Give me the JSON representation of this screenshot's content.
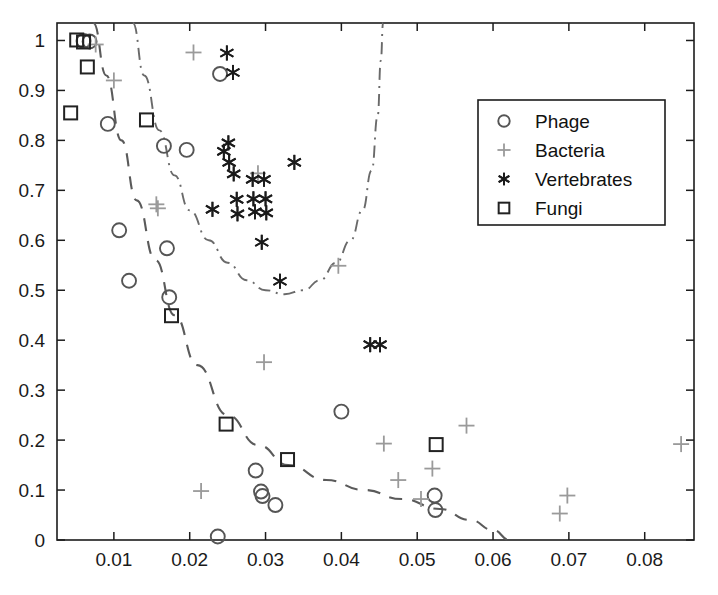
{
  "chart_data": {
    "type": "scatter",
    "title": "",
    "xlabel": "",
    "ylabel": "",
    "xlim": [
      0.0025,
      0.0865
    ],
    "ylim": [
      0.0,
      1.035
    ],
    "grid": false,
    "legend_position": "upper-right",
    "xticks": [
      0.01,
      0.02,
      0.03,
      0.04,
      0.05,
      0.06,
      0.07,
      0.08
    ],
    "xtick_labels": [
      "0.01",
      "0.02",
      "0.03",
      "0.04",
      "0.05",
      "0.06",
      "0.07",
      "0.08"
    ],
    "yticks": [
      0,
      0.1,
      0.2,
      0.3,
      0.4,
      0.5,
      0.6,
      0.7,
      0.8,
      0.9,
      1
    ],
    "ytick_labels": [
      "0",
      "0.1",
      "0.2",
      "0.3",
      "0.4",
      "0.5",
      "0.6",
      "0.7",
      "0.8",
      "0.9",
      "1"
    ],
    "series": [
      {
        "name": "Phage",
        "marker": "circle",
        "color": "#555555",
        "points": [
          [
            0.006,
            0.999
          ],
          [
            0.0068,
            0.998
          ],
          [
            0.0092,
            0.833
          ],
          [
            0.0107,
            0.62
          ],
          [
            0.012,
            0.519
          ],
          [
            0.0166,
            0.789
          ],
          [
            0.017,
            0.584
          ],
          [
            0.0173,
            0.486
          ],
          [
            0.0196,
            0.781
          ],
          [
            0.0237,
            0.007
          ],
          [
            0.024,
            0.933
          ],
          [
            0.0287,
            0.139
          ],
          [
            0.0294,
            0.097
          ],
          [
            0.0296,
            0.088
          ],
          [
            0.0313,
            0.07
          ],
          [
            0.04,
            0.257
          ],
          [
            0.0523,
            0.089
          ],
          [
            0.0524,
            0.06
          ]
        ]
      },
      {
        "name": "Bacteria",
        "marker": "plus",
        "color": "#9a9a9a",
        "points": [
          [
            0.0076,
            0.992
          ],
          [
            0.01,
            0.92
          ],
          [
            0.0156,
            0.672
          ],
          [
            0.0158,
            0.664
          ],
          [
            0.0205,
            0.976
          ],
          [
            0.0215,
            0.098
          ],
          [
            0.029,
            0.734
          ],
          [
            0.0298,
            0.356
          ],
          [
            0.0396,
            0.549
          ],
          [
            0.0456,
            0.193
          ],
          [
            0.0475,
            0.12
          ],
          [
            0.0505,
            0.082
          ],
          [
            0.052,
            0.143
          ],
          [
            0.0565,
            0.229
          ],
          [
            0.0698,
            0.089
          ],
          [
            0.0688,
            0.053
          ],
          [
            0.0848,
            0.192
          ]
        ]
      },
      {
        "name": "Vertebrates",
        "marker": "star",
        "color": "#1b1b1b",
        "points": [
          [
            0.0249,
            0.975
          ],
          [
            0.0257,
            0.936
          ],
          [
            0.0245,
            0.778
          ],
          [
            0.0251,
            0.795
          ],
          [
            0.0252,
            0.756
          ],
          [
            0.0258,
            0.733
          ],
          [
            0.0262,
            0.682
          ],
          [
            0.0263,
            0.653
          ],
          [
            0.0283,
            0.722
          ],
          [
            0.0284,
            0.683
          ],
          [
            0.0286,
            0.657
          ],
          [
            0.0298,
            0.722
          ],
          [
            0.03,
            0.683
          ],
          [
            0.0301,
            0.655
          ],
          [
            0.0295,
            0.596
          ],
          [
            0.0319,
            0.518
          ],
          [
            0.0338,
            0.756
          ],
          [
            0.0438,
            0.391
          ],
          [
            0.0451,
            0.391
          ],
          [
            0.023,
            0.662
          ]
        ]
      },
      {
        "name": "Fungi",
        "marker": "square",
        "color": "#222222",
        "points": [
          [
            0.0043,
            0.855
          ],
          [
            0.0051,
            1.001
          ],
          [
            0.006,
            0.997
          ],
          [
            0.0065,
            0.947
          ],
          [
            0.0143,
            0.841
          ],
          [
            0.0176,
            0.449
          ],
          [
            0.0248,
            0.232
          ],
          [
            0.0329,
            0.161
          ],
          [
            0.0525,
            0.191
          ]
        ]
      }
    ],
    "curves": [
      {
        "name": "dashed-boundary",
        "style": "dashed",
        "color": "#5a5a5a",
        "points": [
          [
            0.0073,
            1.035
          ],
          [
            0.009,
            0.93
          ],
          [
            0.011,
            0.8
          ],
          [
            0.013,
            0.68
          ],
          [
            0.0155,
            0.56
          ],
          [
            0.018,
            0.45
          ],
          [
            0.021,
            0.35
          ],
          [
            0.025,
            0.25
          ],
          [
            0.029,
            0.19
          ],
          [
            0.033,
            0.15
          ],
          [
            0.038,
            0.12
          ],
          [
            0.043,
            0.1
          ],
          [
            0.048,
            0.082
          ],
          [
            0.053,
            0.062
          ],
          [
            0.057,
            0.04
          ],
          [
            0.06,
            0.02
          ],
          [
            0.0622,
            0.0
          ]
        ]
      },
      {
        "name": "dashdot-boundary",
        "style": "dashdot",
        "color": "#6a6a6a",
        "points": [
          [
            0.0125,
            1.035
          ],
          [
            0.014,
            0.93
          ],
          [
            0.016,
            0.82
          ],
          [
            0.018,
            0.73
          ],
          [
            0.02,
            0.66
          ],
          [
            0.0225,
            0.6
          ],
          [
            0.025,
            0.555
          ],
          [
            0.0275,
            0.52
          ],
          [
            0.03,
            0.5
          ],
          [
            0.0325,
            0.492
          ],
          [
            0.035,
            0.5
          ],
          [
            0.0372,
            0.52
          ],
          [
            0.0393,
            0.555
          ],
          [
            0.0412,
            0.6
          ],
          [
            0.0428,
            0.66
          ],
          [
            0.044,
            0.74
          ],
          [
            0.0448,
            0.85
          ],
          [
            0.0452,
            0.96
          ],
          [
            0.0455,
            1.035
          ]
        ]
      }
    ]
  },
  "legend": {
    "entries": [
      {
        "label": "Phage",
        "marker": "circle"
      },
      {
        "label": "Bacteria",
        "marker": "plus"
      },
      {
        "label": "Vertebrates",
        "marker": "star"
      },
      {
        "label": "Fungi",
        "marker": "square"
      }
    ]
  }
}
